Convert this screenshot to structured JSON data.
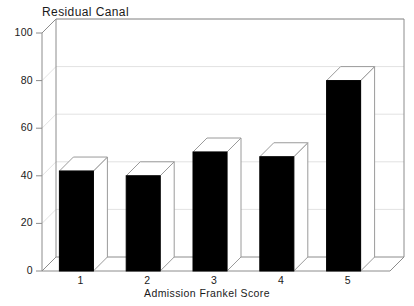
{
  "chart_data": {
    "type": "bar",
    "title": "Residual Canal",
    "subtitle": "",
    "xlabel": "Admission Frankel Score",
    "ylabel": "",
    "categories": [
      "1",
      "2",
      "3",
      "4",
      "5"
    ],
    "values": [
      42,
      40,
      50,
      48,
      80
    ],
    "ylim": [
      0,
      100
    ],
    "yticks": [
      0,
      20,
      40,
      60,
      80,
      100
    ],
    "ytick_labels": [
      "0",
      "20",
      "40",
      "60",
      "80",
      "100"
    ],
    "grid": true,
    "grid_axis": "y",
    "legend": false,
    "legend_position": "none",
    "style": "3d-bar",
    "bar_face_color": "#000000",
    "bar_top_color": "#ffffff",
    "bar_side_color": "#ffffff",
    "bar_edge_color": "#9a9a9a",
    "axis_color": "#8c8c8c",
    "grid_color": "#e2e2e2",
    "text_color": "#1a1a1a",
    "background_color": "#ffffff"
  }
}
